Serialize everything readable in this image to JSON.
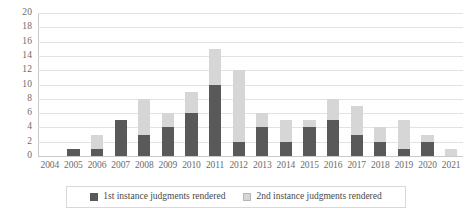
{
  "chart_data": {
    "type": "bar",
    "stacked": true,
    "title": "",
    "subtitle": "",
    "xlabel": "",
    "ylabel": "",
    "ylim": [
      0,
      20
    ],
    "ytick_step": 2,
    "yticks": [
      20,
      18,
      16,
      14,
      12,
      10,
      8,
      6,
      4,
      2,
      0
    ],
    "grid": true,
    "legend_position": "bottom",
    "categories": [
      "2004",
      "2005",
      "2006",
      "2007",
      "2008",
      "2009",
      "2010",
      "2011",
      "2012",
      "2013",
      "2014",
      "2015",
      "2016",
      "2017",
      "2018",
      "2019",
      "2020",
      "2021"
    ],
    "series": [
      {
        "name": "1st instance judgments rendered",
        "color": "#595959",
        "values": [
          0,
          1,
          1,
          5,
          3,
          4,
          6,
          10,
          2,
          4,
          2,
          4,
          5,
          3,
          2,
          1,
          2,
          0
        ]
      },
      {
        "name": "2nd instance judgments rendered",
        "color": "#d6d6d6",
        "values": [
          0,
          0,
          2,
          0,
          5,
          2,
          3,
          5,
          10,
          2,
          3,
          1,
          3,
          4,
          2,
          4,
          1,
          1
        ]
      }
    ],
    "totals": [
      0,
      1,
      3,
      5,
      8,
      6,
      9,
      15,
      12,
      6,
      5,
      5,
      8,
      7,
      4,
      5,
      3,
      1
    ]
  },
  "legend": {
    "items": [
      {
        "label": "1st instance judgments rendered",
        "swatch": "dark-gray-swatch"
      },
      {
        "label": "2nd instance judgments rendered",
        "swatch": "light-gray-swatch"
      }
    ]
  }
}
